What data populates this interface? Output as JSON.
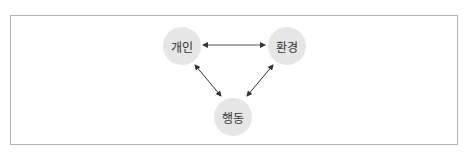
{
  "diagram": {
    "type": "triangular-reciprocal-relationship",
    "nodes": [
      {
        "id": "individual",
        "label": "개인",
        "cx": 182,
        "cy": 46
      },
      {
        "id": "environment",
        "label": "환경",
        "cx": 287,
        "cy": 46
      },
      {
        "id": "behavior",
        "label": "행동",
        "cx": 233,
        "cy": 117
      }
    ],
    "edges": [
      {
        "from": "individual",
        "to": "environment",
        "direction": "bidirectional"
      },
      {
        "from": "individual",
        "to": "behavior",
        "direction": "bidirectional"
      },
      {
        "from": "environment",
        "to": "behavior",
        "direction": "bidirectional"
      }
    ],
    "colors": {
      "node_fill": "#e6e6e6",
      "node_text": "#333333",
      "arrow": "#333333",
      "frame_border": "#b4b4b4"
    }
  }
}
